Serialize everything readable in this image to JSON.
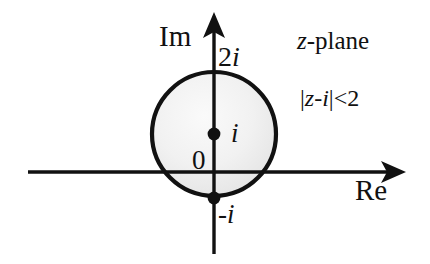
{
  "figure": {
    "plane_label": {
      "var": "z",
      "suffix": "-plane",
      "full": "z-plane"
    },
    "axes": {
      "imaginary": {
        "label": "Im",
        "arrow": "arrow-up",
        "x": 214,
        "y_top": 13,
        "y_bottom": 254
      },
      "real": {
        "label": "Re",
        "arrow": "arrow-right",
        "y": 172,
        "x_left": 28,
        "x_right": 405
      }
    },
    "origin_label": "0",
    "ticks": [
      {
        "name": "top-of-circle",
        "text": "2i",
        "coefficient": "2",
        "unit": "i",
        "x": 214,
        "y": 70
      },
      {
        "name": "bottom-of-circle",
        "text": "-i",
        "sign": "-",
        "unit": "i",
        "x": 214,
        "y": 198
      },
      {
        "name": "center",
        "text": "i",
        "unit": "i",
        "x": 214,
        "y": 134
      }
    ],
    "region": {
      "inequality": {
        "full": "|z-i|<2",
        "expression": "z-i",
        "relation": "<",
        "bound": "2",
        "bar": "|"
      },
      "shape": "circle",
      "center": {
        "x": 214,
        "y": 134,
        "value": "i"
      },
      "radius_px": 64,
      "radius_value": 2,
      "fill_color": "#f1f1f1",
      "stroke_color": "#111111",
      "stroke_width": 4
    },
    "points": [
      {
        "name": "center-point",
        "label": "i",
        "x": 214,
        "y": 134,
        "r": 6
      },
      {
        "name": "bottom-point",
        "label": "-i",
        "x": 214,
        "y": 198,
        "r": 6
      }
    ],
    "colors": {
      "background": "#ffffff",
      "ink": "#111111",
      "region_fill": "#f1f1f1"
    }
  }
}
